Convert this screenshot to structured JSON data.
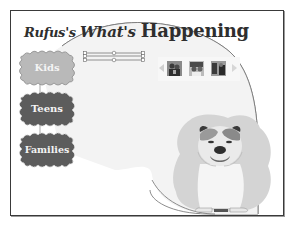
{
  "header": {
    "title_parts": [
      "Rufus",
      "'s ",
      "What's ",
      "Happening"
    ],
    "title_full": "Rufus's What's Happening"
  },
  "nav": {
    "items": [
      {
        "label": "Kids",
        "fill": "#b9b9b9",
        "state": "selected"
      },
      {
        "label": "Teens",
        "fill": "#5c5c5c",
        "state": "default"
      },
      {
        "label": "Families",
        "fill": "#5c5c5c",
        "state": "default"
      }
    ]
  },
  "timeline_slider": {
    "tracks": 2,
    "handles": [
      "start",
      "middle",
      "end"
    ]
  },
  "photo_strip": {
    "prev_label": "previous",
    "next_label": "next",
    "thumbnails": [
      {
        "alt": "photo 1"
      },
      {
        "alt": "photo 2"
      },
      {
        "alt": "photo 3"
      }
    ]
  },
  "mascot": {
    "alt": "Rufus the bulldog"
  },
  "colors": {
    "frame_border": "#3a3a3a",
    "panel_fill": "#f2f2f2",
    "panel_stroke": "#707070",
    "title_text": "#2e2e2e",
    "kids_button": "#b9b9b9",
    "dark_button": "#5c5c5c",
    "blob": "#d4d4d4"
  }
}
